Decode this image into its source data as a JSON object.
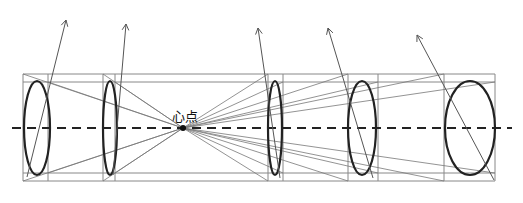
{
  "diagram": {
    "title": "",
    "center_label": "心点",
    "center_point": {
      "x": 183,
      "y": 128
    },
    "axis": {
      "y": 128,
      "x1": 12,
      "x2": 512,
      "style": "dashed"
    },
    "frame": {
      "top": 74,
      "inner_top": 82,
      "inner_bottom": 173,
      "bottom": 181
    },
    "sections": [
      {
        "x1": 23,
        "x2": 48,
        "ellipse": {
          "cx": 37,
          "cy": 128,
          "rx": 13,
          "ry": 47
        }
      },
      {
        "x1": 103,
        "x2": 115,
        "ellipse": {
          "cx": 110,
          "cy": 128,
          "rx": 7,
          "ry": 47
        }
      },
      {
        "x1": 268,
        "x2": 283,
        "ellipse": {
          "cx": 275,
          "cy": 128,
          "rx": 7,
          "ry": 47
        }
      },
      {
        "x1": 348,
        "x2": 378,
        "ellipse": {
          "cx": 362,
          "cy": 128,
          "rx": 14,
          "ry": 47
        }
      },
      {
        "x1": 444,
        "x2": 495,
        "ellipse": {
          "cx": 470,
          "cy": 128,
          "rx": 25,
          "ry": 47
        }
      }
    ],
    "arrows": [
      {
        "from": [
          27,
          177
        ],
        "to": [
          66,
          20
        ]
      },
      {
        "from": [
          113,
          175
        ],
        "to": [
          126,
          24
        ]
      },
      {
        "from": [
          280,
          178
        ],
        "to": [
          258,
          28
        ]
      },
      {
        "from": [
          373,
          178
        ],
        "to": [
          328,
          28
        ]
      },
      {
        "from": [
          494,
          180
        ],
        "to": [
          417,
          35
        ]
      }
    ],
    "colors": {
      "ink": "#222222",
      "construction": "#888888"
    }
  }
}
